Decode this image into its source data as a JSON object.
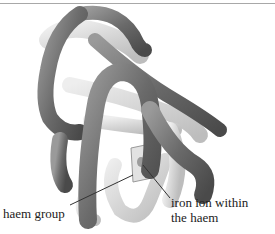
{
  "figure": {
    "labels": {
      "haem_group": "haem group",
      "iron_ion_line1": "iron ion within",
      "iron_ion_line2": "the haem"
    },
    "colors": {
      "dark_tube": "#6e6e6e",
      "light_tube": "#d9d9d9",
      "leader_line": "#333333",
      "top_rule": "#a8a8a8"
    }
  }
}
